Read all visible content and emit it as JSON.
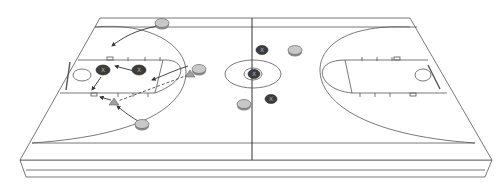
{
  "diagram": {
    "type": "basketball-play-diagram",
    "view": "3d-perspective-court",
    "colors": {
      "court_fill": "#ffffff",
      "line": "#444444",
      "offense_fill": "#c8c8c8",
      "offense_stroke": "#6a6a6a",
      "defense_fill": "#3c3c3c",
      "defense_stroke": "#222222",
      "cone_fill": "#a0a0a0"
    },
    "players": {
      "offense": [
        {
          "id": "o1",
          "x": 162,
          "y": 23
        },
        {
          "id": "o2",
          "x": 199,
          "y": 69
        },
        {
          "id": "o3",
          "x": 142,
          "y": 124
        },
        {
          "id": "o4",
          "x": 295,
          "y": 50
        },
        {
          "id": "o5",
          "x": 244,
          "y": 104
        }
      ],
      "defense": [
        {
          "id": "x1",
          "x": 103,
          "y": 70,
          "label": "X"
        },
        {
          "id": "x2",
          "x": 139,
          "y": 70,
          "label": "X"
        },
        {
          "id": "x3",
          "x": 262,
          "y": 50,
          "label": "X"
        },
        {
          "id": "x4",
          "x": 254,
          "y": 74,
          "label": "X"
        },
        {
          "id": "x5",
          "x": 271,
          "y": 99,
          "label": "X"
        }
      ],
      "cones": [
        {
          "id": "c1",
          "x": 190,
          "y": 74
        },
        {
          "id": "c2",
          "x": 114,
          "y": 102
        }
      ]
    }
  }
}
